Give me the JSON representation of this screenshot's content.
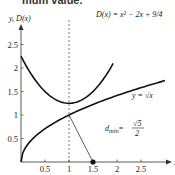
{
  "cropped_header_text": "mum value.",
  "chart_data": {
    "type": "line",
    "title": "",
    "xlabel": "x",
    "ylabel": "y, D(x)",
    "xlim": [
      0,
      3.1
    ],
    "ylim": [
      0,
      2.8
    ],
    "x_ticks": [
      0.5,
      1,
      1.5,
      2,
      2.5
    ],
    "x_tick_labels": [
      "0.5",
      "1",
      "1.5",
      "2",
      "2.5"
    ],
    "y_ticks": [
      0.5,
      1,
      1.5,
      2,
      2.5
    ],
    "y_tick_labels": [
      "0.5",
      "1",
      "1.5",
      "2",
      "2.5"
    ],
    "grid": false,
    "series": [
      {
        "name": "D(x) = x^2 - 2x + 9/4",
        "label_text": "D(x) = x² − 2x + 9/4",
        "x": [
          0,
          0.25,
          0.5,
          0.75,
          1,
          1.25,
          1.5,
          1.75,
          1.92
        ],
        "y": [
          2.25,
          1.8125,
          1.5,
          1.3125,
          1.25,
          1.3125,
          1.5,
          1.8125,
          2.09
        ]
      },
      {
        "name": "y = sqrt(x)",
        "label_text": "y = √x",
        "x": [
          0,
          0.05,
          0.25,
          0.5,
          1,
          1.5,
          2,
          2.5,
          3.0
        ],
        "y": [
          0,
          0.2236,
          0.5,
          0.7071,
          1,
          1.2247,
          1.4142,
          1.5811,
          1.7321
        ]
      }
    ],
    "annotations": [
      {
        "type": "vline",
        "x": 1,
        "style": "dashed"
      },
      {
        "type": "segment",
        "from": [
          1,
          1
        ],
        "to": [
          1.5,
          0
        ]
      },
      {
        "type": "point",
        "x": 1.5,
        "y": 0
      },
      {
        "type": "text",
        "text": "d_min = √5 / 2",
        "d_label": "d",
        "sub": "min",
        "eq": "=",
        "num": "√5",
        "den": "2"
      }
    ]
  }
}
